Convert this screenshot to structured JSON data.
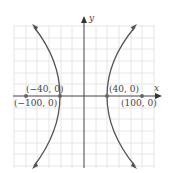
{
  "graph": {
    "type": "hyperbola",
    "axes": {
      "x_label": "x",
      "y_label": "y"
    },
    "points": [
      {
        "id": "vertex-left",
        "label": "(−40, 0)"
      },
      {
        "id": "vertex-right",
        "label": "(40, 0)"
      },
      {
        "id": "focus-left",
        "label": "(−100, 0)"
      },
      {
        "id": "focus-right",
        "label": "(100, 0)"
      }
    ],
    "colors": {
      "curve": "#555555",
      "axis": "#444444",
      "grid": "#e4e4e4",
      "point": "#666666"
    }
  }
}
